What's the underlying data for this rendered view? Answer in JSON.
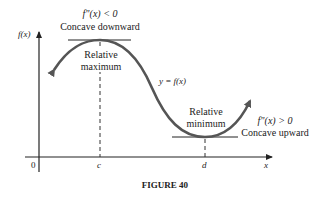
{
  "figure": {
    "caption": "FIGURE 40",
    "y_axis_label": "f(x)",
    "x_axis_label": "x",
    "origin_label": "0",
    "curve_label": "y = f(x)",
    "points": {
      "c": "c",
      "d": "d"
    },
    "maximum": {
      "label_line1": "Relative",
      "label_line2": "maximum",
      "condition": "f\"(x) < 0",
      "concavity": "Concave downward"
    },
    "minimum": {
      "label_line1": "Relative",
      "label_line2": "minimum",
      "condition": "f\"(x) > 0",
      "concavity": "Concave upward"
    },
    "colors": {
      "curve": "#555555",
      "axes": "#222222",
      "text": "#222222"
    }
  }
}
